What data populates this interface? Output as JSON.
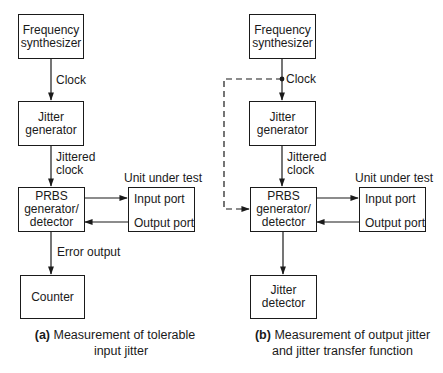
{
  "panel_a": {
    "blocks": {
      "frequency_synthesizer": [
        "Frequency",
        "synthesizer"
      ],
      "jitter_generator": [
        "Jitter",
        "generator"
      ],
      "prbs": [
        "PRBS",
        "generator/",
        "detector"
      ],
      "counter": [
        "Counter"
      ]
    },
    "unit_under_test": {
      "title": "Unit under test",
      "input_port": "Input port",
      "output_port": "Output port"
    },
    "signals": {
      "clock": "Clock",
      "jittered_clock": [
        "Jittered",
        "clock"
      ],
      "error_output": "Error output"
    },
    "caption": {
      "tag": "(a)",
      "line1": "Measurement of tolerable",
      "line2": "input jitter"
    }
  },
  "panel_b": {
    "blocks": {
      "frequency_synthesizer": [
        "Frequency",
        "synthesizer"
      ],
      "jitter_generator": [
        "Jitter",
        "generator"
      ],
      "prbs": [
        "PRBS",
        "generator/",
        "detector"
      ],
      "jitter_detector": [
        "Jitter",
        "detector"
      ]
    },
    "unit_under_test": {
      "title": "Unit under test",
      "input_port": "Input port",
      "output_port": "Output port"
    },
    "signals": {
      "clock": "Clock",
      "jittered_clock": [
        "Jittered",
        "clock"
      ]
    },
    "caption": {
      "tag": "(b)",
      "line1": "Measurement of output jitter",
      "line2": "and jitter transfer function"
    }
  },
  "colors": {
    "line": "#1a1a1a",
    "background": "#ffffff"
  }
}
